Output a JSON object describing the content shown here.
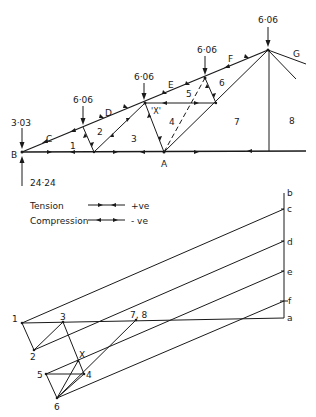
{
  "truss": {
    "node_labels": {
      "B": "B",
      "A": "A"
    },
    "space_labels": {
      "C": "C",
      "D": "D",
      "E": "E",
      "F": "F",
      "G": "G",
      "s1": "1",
      "s2": "2",
      "s3": "3",
      "s4": "4",
      "s5": "5",
      "s6": "6",
      "s7": "7",
      "s8": "8",
      "X": "'X'"
    },
    "loads": [
      {
        "id": "load-end",
        "value": "3·03"
      },
      {
        "id": "load-1",
        "value": "6·06"
      },
      {
        "id": "load-2",
        "value": "6·06"
      },
      {
        "id": "load-3",
        "value": "6·06"
      },
      {
        "id": "load-apex",
        "value": "6·06"
      }
    ],
    "reaction": {
      "value": "24·24"
    }
  },
  "legend": {
    "tension_label": "Tension",
    "tension_sign": "+ve",
    "compression_label": "Compression",
    "compression_sign": "- ve"
  },
  "force_diagram": {
    "load_line_labels": {
      "b": "b",
      "c": "c",
      "d": "d",
      "e": "e",
      "f": "f",
      "a": "a"
    },
    "point_labels": {
      "p1": "1",
      "p2": "2",
      "p3": "3",
      "p4": "4",
      "p5": "5",
      "p6": "6",
      "pX": "X",
      "p78": "7, 8"
    }
  }
}
